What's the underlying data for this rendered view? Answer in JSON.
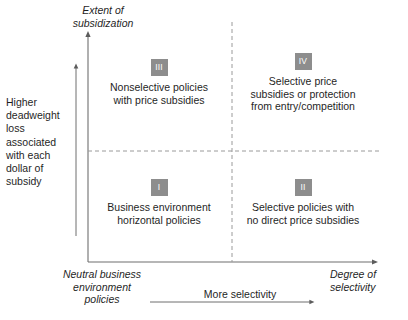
{
  "figure": {
    "type": "2x2-matrix-diagram",
    "y_axis_title": "Extent of\nsubsidization",
    "x_axis_title": "Degree of\nselectivity",
    "origin_label": "Neutral business\nenvironment\npolicies",
    "left_note": "Higher\ndeadweight\nloss\nassociated\nwith each\ndollar of\nsubsidy",
    "selectivity_note": "More selectivity",
    "badge_color": "#8d8d8d",
    "badge_text_color": "#ffffff",
    "line_color": "#6f6f6f",
    "quadrants": [
      {
        "id": "I",
        "badge": "I",
        "text": "Business environment\nhorizontal policies",
        "position": "lower-left"
      },
      {
        "id": "II",
        "badge": "II",
        "text": "Selective policies with\nno direct price subsidies",
        "position": "lower-right"
      },
      {
        "id": "III",
        "badge": "III",
        "text": "Nonselective policies\nwith price subsidies",
        "position": "upper-left"
      },
      {
        "id": "IV",
        "badge": "IV",
        "text": "Selective price\nsubsidies or protection\nfrom entry/competition",
        "position": "upper-right"
      }
    ]
  }
}
